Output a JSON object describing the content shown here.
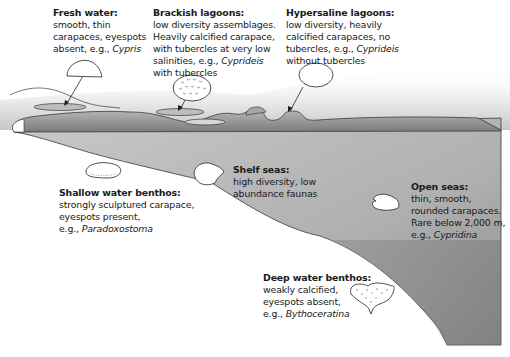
{
  "diagram": {
    "type": "cross-section",
    "colors": {
      "water_dark": "#7d7d7d",
      "water_mid": "#a9a9a9",
      "water_light": "#c2c2c2",
      "outline": "#3a3a3a",
      "background": "#ffffff",
      "text": "#1a1a1a"
    }
  },
  "labels": {
    "fresh_water": {
      "title": "Fresh water:",
      "lines": [
        "smooth, thin",
        "carapaces, eyespots"
      ],
      "example_prefix": "absent, e.g., ",
      "genus": "Cypris"
    },
    "brackish_lagoons": {
      "title": "Brackish lagoons:",
      "lines": [
        "low diversity assemblages.",
        "Heavily calcified carapace,",
        "with tubercles at very low"
      ],
      "example_prefix": "salinities, e.g., ",
      "genus": "Cyprideis",
      "suffix": "with tubercles"
    },
    "hypersaline_lagoons": {
      "title": "Hypersaline lagoons:",
      "lines": [
        "low diversity, heavily",
        "calcified carapaces, no"
      ],
      "example_prefix": "tubercles, e.g., ",
      "genus": "Cyprideis",
      "suffix": "without tubercles"
    },
    "shelf_seas": {
      "title": "Shelf seas:",
      "lines": [
        "high diversity, low",
        "abundance faunas"
      ]
    },
    "shallow_water_benthos": {
      "title": "Shallow water benthos:",
      "lines": [
        "strongly sculptured carapace,",
        "eyespots present,"
      ],
      "example_prefix": "e.g., ",
      "genus": "Paradoxostoma"
    },
    "open_seas": {
      "title": "Open seas:",
      "lines": [
        "thin, smooth,",
        "rounded carapaces.",
        "Rare below 2,000 m,"
      ],
      "example_prefix": "e.g., ",
      "genus": "Cypridina"
    },
    "deep_water_benthos": {
      "title": "Deep water benthos:",
      "lines": [
        "weakly calcified,",
        "eyespots absent,"
      ],
      "example_prefix": "e.g., ",
      "genus": "Bythoceratina"
    }
  },
  "icons": {
    "fresh_water": "cypris-carapace-icon",
    "brackish": "tuberculate-cyprideis-icon",
    "hypersaline": "smooth-cyprideis-icon",
    "shallow": "paradoxostoma-icon",
    "shelf": "shelf-ostracod-icon",
    "open": "cypridina-icon",
    "deep": "bythoceratina-icon"
  }
}
